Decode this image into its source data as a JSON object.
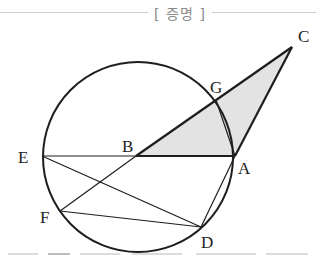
{
  "header": {
    "title": "[ 증명 ]"
  },
  "diagram": {
    "colors": {
      "stroke": "#1e1e1e",
      "shade": "#e3e3e3",
      "header_text": "#8a8a8a",
      "rule": "#cfcfcf"
    },
    "circle": {
      "cx": 138,
      "cy": 157,
      "r": 95
    },
    "points": {
      "A": {
        "x": 235,
        "y": 156,
        "label": "A"
      },
      "B": {
        "x": 136,
        "y": 156,
        "label": "B"
      },
      "C": {
        "x": 292,
        "y": 47,
        "label": "C"
      },
      "D": {
        "x": 201,
        "y": 227,
        "label": "D"
      },
      "E": {
        "x": 42,
        "y": 156,
        "label": "E"
      },
      "F": {
        "x": 60,
        "y": 211,
        "label": "F"
      },
      "G": {
        "x": 216,
        "y": 100,
        "label": "G"
      }
    },
    "shaded_region": [
      "B",
      "C",
      "A"
    ],
    "segments": [
      [
        "E",
        "A"
      ],
      [
        "B",
        "C"
      ],
      [
        "C",
        "A"
      ],
      [
        "B",
        "F"
      ],
      [
        "E",
        "D"
      ],
      [
        "F",
        "D"
      ],
      [
        "A",
        "D"
      ],
      [
        "G",
        "A"
      ]
    ]
  }
}
